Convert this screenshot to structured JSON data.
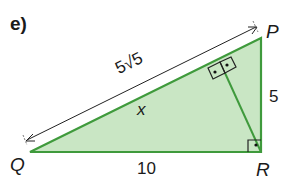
{
  "part_label": "e)",
  "vertices": {
    "P": "P",
    "Q": "Q",
    "R": "R"
  },
  "side_labels": {
    "QP": "5√5",
    "PR": "5",
    "QR": "10"
  },
  "unknown_label": "x",
  "colors": {
    "fill": "#c9e6c4",
    "edge": "#3f9a3c",
    "altitude": "#3f9a3c",
    "arrow": "#222222",
    "marker": "#222222"
  }
}
